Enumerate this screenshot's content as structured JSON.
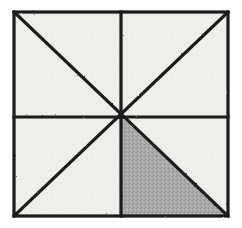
{
  "figure": {
    "title": "Square divided by two diagonals and two midlines with one shaded triangle",
    "description": "Hand-drawn square partitioned into eight congruent right triangles by its two diagonals and its horizontal and vertical midlines. The triangle in the lower-right quadrant adjacent to the vertical midline and the bottom side is shaded gray.",
    "shaded_fraction_label": "1/8"
  },
  "canvas": {
    "width": 242,
    "height": 228,
    "background_color": "#ffffff"
  },
  "colors": {
    "paper": "#ffffff",
    "interior_fill": "#f0efec",
    "shaded_fill": "#a9a9a9",
    "stroke": "#1a1a1a",
    "texture_speckle": "#c9c7c3"
  },
  "geometry": {
    "square": {
      "left": 14,
      "top": 12,
      "right": 228,
      "bottom": 216,
      "width": 214,
      "height": 204,
      "corners": {
        "top_left": [
          14,
          12
        ],
        "top_right": [
          228,
          12
        ],
        "bottom_right": [
          228,
          216
        ],
        "bottom_left": [
          14,
          216
        ]
      }
    },
    "center": [
      121,
      117
    ],
    "midpoints": {
      "top": [
        121,
        12
      ],
      "bottom": [
        121,
        216
      ],
      "left": [
        14,
        117
      ],
      "right": [
        228,
        117
      ]
    },
    "stroke_width": 3.2,
    "lines": [
      {
        "name": "square-outline",
        "kind": "border"
      },
      {
        "name": "diagonal-top-left-to-bottom-right",
        "from": [
          14,
          12
        ],
        "to": [
          228,
          216
        ]
      },
      {
        "name": "diagonal-top-right-to-bottom-left",
        "from": [
          228,
          12
        ],
        "to": [
          14,
          216
        ]
      },
      {
        "name": "midline-vertical",
        "from": [
          121,
          12
        ],
        "to": [
          121,
          216
        ]
      },
      {
        "name": "midline-horizontal",
        "from": [
          14,
          117
        ],
        "to": [
          228,
          117
        ]
      }
    ],
    "shaded_triangle": {
      "name": "shaded-triangle",
      "vertices": [
        [
          121,
          117
        ],
        [
          121,
          216
        ],
        [
          228,
          216
        ]
      ],
      "points_string": "121,117 121,216 228,216",
      "quadrant": "lower-right",
      "fraction_of_square": 0.125
    },
    "regions": [
      {
        "name": "region-upper-left-outer",
        "points_string": "14,12 121,12 121,117",
        "shaded": false
      },
      {
        "name": "region-upper-left-inner",
        "points_string": "14,12 121,117 14,117",
        "shaded": false
      },
      {
        "name": "region-upper-right-inner",
        "points_string": "121,12 228,12 121,117",
        "shaded": false
      },
      {
        "name": "region-upper-right-outer",
        "points_string": "228,12 228,117 121,117",
        "shaded": false
      },
      {
        "name": "region-lower-right-upper",
        "points_string": "121,117 228,117 228,216",
        "shaded": false
      },
      {
        "name": "region-lower-right-lower",
        "points_string": "121,117 121,216 228,216",
        "shaded": true
      },
      {
        "name": "region-lower-left-lower",
        "points_string": "121,117 14,216 121,216",
        "shaded": false
      },
      {
        "name": "region-lower-left-upper",
        "points_string": "14,117 121,117 14,216",
        "shaded": false
      }
    ]
  }
}
